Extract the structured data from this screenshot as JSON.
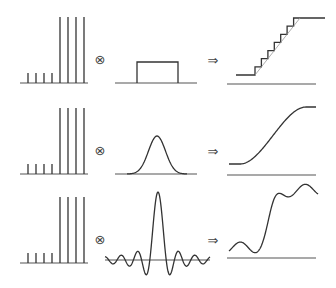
{
  "symbols": {
    "convolve": "⊗",
    "implies": "⇒"
  },
  "rows": [
    {
      "name": "box-kernel",
      "spike_heights": [
        0.15,
        0.15,
        0.15,
        0.15,
        1,
        1,
        1,
        1
      ],
      "kernel": "box",
      "result": "staircase"
    },
    {
      "name": "gaussian-kernel",
      "spike_heights": [
        0.15,
        0.15,
        0.15,
        0.15,
        1,
        1,
        1,
        1
      ],
      "kernel": "gaussian",
      "result": "smooth-step"
    },
    {
      "name": "sinc-kernel",
      "spike_heights": [
        0.15,
        0.15,
        0.15,
        0.15,
        1,
        1,
        1,
        1
      ],
      "kernel": "sinc",
      "result": "ringing-step"
    }
  ],
  "colors": {
    "line": "#333333",
    "axis": "#555555"
  }
}
